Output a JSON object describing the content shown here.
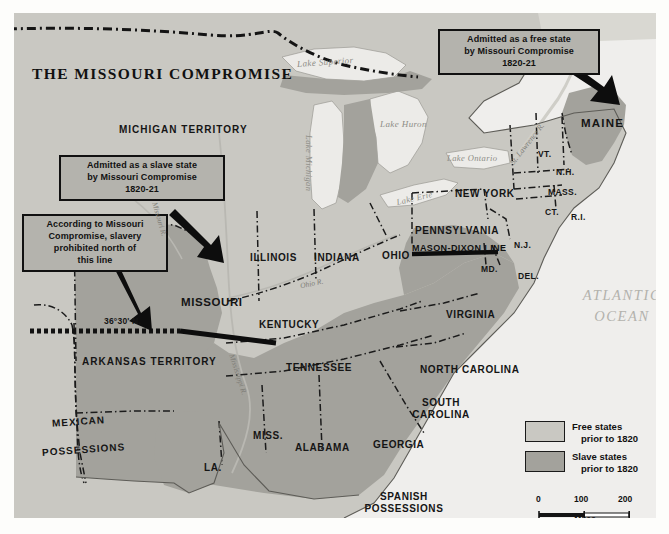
{
  "map": {
    "title": "THE MISSOURI COMPROMISE",
    "callouts": [
      {
        "id": "free-state",
        "text": "Admitted as a free state\nby Missouri Compromise\n1820-21"
      },
      {
        "id": "slave-state",
        "text": "Admitted as a slave state\nby Missouri Compromise\n1820-21"
      },
      {
        "id": "compromise-line",
        "text": "According to Missouri\nCompromise, slavery\nprohibited north of\nthis line"
      }
    ],
    "lines": {
      "parallel": "36°30' N.",
      "mason_dixon": "MASON-DIXON LINE"
    },
    "states": [
      {
        "name": "MICHIGAN TERRITORY",
        "status": "territory"
      },
      {
        "name": "ILLINOIS",
        "status": "free"
      },
      {
        "name": "INDIANA",
        "status": "free"
      },
      {
        "name": "OHIO",
        "status": "free"
      },
      {
        "name": "MISSOURI",
        "status": "slave"
      },
      {
        "name": "ARKANSAS TERRITORY",
        "status": "territory"
      },
      {
        "name": "KENTUCKY",
        "status": "slave"
      },
      {
        "name": "TENNESSEE",
        "status": "slave"
      },
      {
        "name": "MISS.",
        "status": "slave"
      },
      {
        "name": "ALABAMA",
        "status": "slave"
      },
      {
        "name": "GEORGIA",
        "status": "slave"
      },
      {
        "name": "LA.",
        "status": "slave"
      },
      {
        "name": "VIRGINIA",
        "status": "slave"
      },
      {
        "name": "NORTH CAROLINA",
        "status": "slave"
      },
      {
        "name": "SOUTH CAROLINA",
        "status": "slave"
      },
      {
        "name": "PENNSYLVANIA",
        "status": "free"
      },
      {
        "name": "NEW YORK",
        "status": "free"
      },
      {
        "name": "MAINE",
        "status": "free"
      },
      {
        "name": "VT.",
        "status": "free"
      },
      {
        "name": "N.H.",
        "status": "free"
      },
      {
        "name": "MASS.",
        "status": "free"
      },
      {
        "name": "CT.",
        "status": "free"
      },
      {
        "name": "R.I.",
        "status": "free"
      },
      {
        "name": "N.J.",
        "status": "free"
      },
      {
        "name": "MD.",
        "status": "slave"
      },
      {
        "name": "DEL.",
        "status": "slave"
      }
    ],
    "state_labels": {
      "michigan_territory": "MICHIGAN TERRITORY",
      "illinois": "ILLINOIS",
      "indiana": "INDIANA",
      "ohio": "OHIO",
      "missouri": "MISSOURI",
      "arkansas_territory": "ARKANSAS TERRITORY",
      "kentucky": "KENTUCKY",
      "tennessee": "TENNESSEE",
      "mississippi": "MISS.",
      "alabama": "ALABAMA",
      "georgia": "GEORGIA",
      "louisiana": "LA.",
      "virginia": "VIRGINIA",
      "north_carolina": "NORTH CAROLINA",
      "south_carolina_1": "SOUTH",
      "south_carolina_2": "CAROLINA",
      "pennsylvania": "PENNSYLVANIA",
      "new_york": "NEW YORK",
      "maine": "MAINE",
      "vermont": "VT.",
      "new_hampshire": "N.H.",
      "massachusetts": "MASS.",
      "connecticut": "CT.",
      "rhode_island": "R.I.",
      "new_jersey": "N.J.",
      "maryland": "MD.",
      "delaware": "DEL."
    },
    "foreign": {
      "mexican_1": "MEXICAN",
      "mexican_2": "POSSESSIONS",
      "spanish_1": "SPANISH",
      "spanish_2": "POSSESSIONS"
    },
    "water_labels": {
      "lake_superior": "Lake Superior",
      "lake_michigan": "Lake Michigan",
      "lake_huron": "Lake Huron",
      "lake_ontario": "Lake Ontario",
      "lake_erie": "Lake Erie",
      "atlantic_1": "ATLANTIC",
      "atlantic_2": "OCEAN"
    },
    "rivers": {
      "missouri_r": "Missouri R.",
      "mississippi_r": "Mississippi R.",
      "ohio_r": "Ohio R.",
      "st_lawrence_r": "St. Lawrence R."
    }
  },
  "legend": {
    "free": {
      "label": "Free states",
      "sub": "prior to 1820"
    },
    "slave": {
      "label": "Slave states",
      "sub": "prior to 1820"
    }
  },
  "scale": {
    "ticks": [
      "0",
      "100",
      "200"
    ],
    "unit": "Miles"
  },
  "colors": {
    "free_state": "#c9c8c2",
    "slave_state": "#a3a29c",
    "water": "#ececea",
    "background": "#d9d8d2",
    "ink": "#111111",
    "callout_fill": "#b4b3ad"
  }
}
